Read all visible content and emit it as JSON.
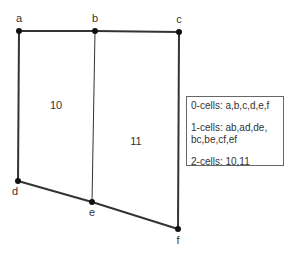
{
  "diagram": {
    "vertices": [
      {
        "id": "a",
        "x": 19,
        "y": 31,
        "lx": 19,
        "ly": 22
      },
      {
        "id": "b",
        "x": 95,
        "y": 31,
        "lx": 95,
        "ly": 22
      },
      {
        "id": "c",
        "x": 179,
        "y": 32,
        "lx": 179,
        "ly": 23
      },
      {
        "id": "d",
        "x": 18,
        "y": 181,
        "lx": 15,
        "ly": 195
      },
      {
        "id": "e",
        "x": 92,
        "y": 202,
        "lx": 92,
        "ly": 216
      },
      {
        "id": "f",
        "x": 178,
        "y": 229,
        "lx": 178,
        "ly": 244
      }
    ],
    "edges": [
      {
        "id": "ab",
        "from": "a",
        "to": "b",
        "width": 2
      },
      {
        "id": "bc",
        "from": "b",
        "to": "c",
        "width": 2
      },
      {
        "id": "ad",
        "from": "a",
        "to": "d",
        "width": 2
      },
      {
        "id": "be",
        "from": "b",
        "to": "e",
        "width": 1
      },
      {
        "id": "cf",
        "from": "c",
        "to": "f",
        "width": 2
      },
      {
        "id": "de",
        "from": "d",
        "to": "e",
        "width": 2
      },
      {
        "id": "ef",
        "from": "e",
        "to": "f",
        "width": 2
      }
    ],
    "faces": [
      {
        "id": "10",
        "x": 56,
        "y": 109
      },
      {
        "id": "11",
        "x": 136,
        "y": 145
      }
    ],
    "colors": {
      "line": "#333333",
      "vertex": "#111111"
    }
  },
  "legend": {
    "zero_cells": "0-cells: a,b,c,d,e,f",
    "one_cells_line1": "1-cells: ab,ad,de,",
    "one_cells_line2": "bc,be,cf,ef",
    "two_cells": "2-cells: 10,11"
  }
}
